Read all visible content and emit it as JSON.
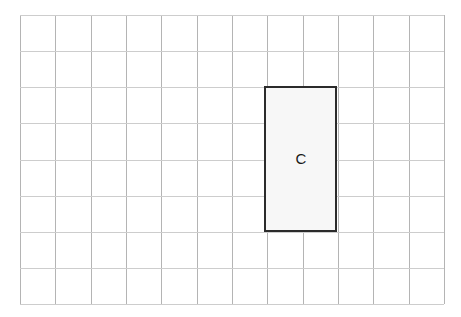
{
  "figure": {
    "width": 461,
    "height": 317,
    "background_color": "#ffffff"
  },
  "grid": {
    "name": "square-grid",
    "columns": 12,
    "rows": 8,
    "origin_x": 20,
    "origin_y": 15,
    "cell_width": 35.33,
    "cell_height": 36.13,
    "line_color_vertical": "#b4b4b4",
    "line_color_horizontal": "#cdcdcd",
    "line_width": 1
  },
  "shapes": [
    {
      "id": "rect-c",
      "type": "rectangle",
      "label": "C",
      "col_start": 7,
      "col_end": 9,
      "row_start": 2,
      "row_end": 6,
      "x": 264,
      "y": 86,
      "width": 73,
      "height": 146,
      "cells_wide": 2,
      "cells_tall": 4,
      "area_cells": 8,
      "fill_color": "#f7f7f7",
      "stroke_color": "#2b2b2b",
      "stroke_width": 2,
      "label_x": 301,
      "label_y": 158,
      "label_color": "#1a1a1a"
    }
  ],
  "chart_data": {
    "type": "table",
    "categories": [
      "C"
    ],
    "values": [
      8
    ],
    "xlabel": "",
    "ylabel": "area (grid squares)",
    "annotations": [
      "C"
    ],
    "grid": true,
    "legend": "none"
  }
}
